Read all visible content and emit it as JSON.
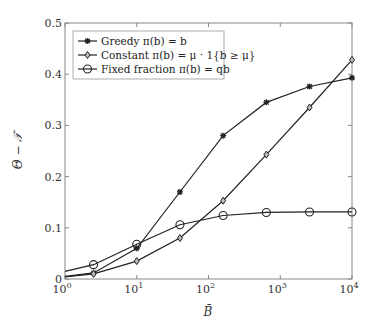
{
  "chart_data": {
    "type": "line",
    "title": "",
    "xlabel": "B̄",
    "ylabel": "Θ − 𝒯",
    "xscale": "log",
    "xlim": [
      1,
      10000
    ],
    "ylim": [
      0,
      0.5
    ],
    "grid": false,
    "legend_position": "upper left",
    "x_ticks": [
      {
        "v": 1,
        "base": "10",
        "exp": "0"
      },
      {
        "v": 10,
        "base": "10",
        "exp": "1"
      },
      {
        "v": 100,
        "base": "10",
        "exp": "2"
      },
      {
        "v": 1000,
        "base": "10",
        "exp": "3"
      },
      {
        "v": 10000,
        "base": "10",
        "exp": "4"
      }
    ],
    "y_ticks": [
      {
        "v": 0,
        "label": "0"
      },
      {
        "v": 0.1,
        "label": "0.1"
      },
      {
        "v": 0.2,
        "label": "0.2"
      },
      {
        "v": 0.3,
        "label": "0.3"
      },
      {
        "v": 0.4,
        "label": "0.4"
      },
      {
        "v": 0.5,
        "label": "0.5"
      }
    ],
    "x": [
      1,
      2.5,
      10,
      40,
      160,
      640,
      2560,
      10000
    ],
    "series": [
      {
        "name": "Greedy π(b) = b",
        "marker": "asterisk",
        "values": [
          0.005,
          0.012,
          0.06,
          0.17,
          0.28,
          0.345,
          0.376,
          0.393
        ]
      },
      {
        "name": "Constant π(b) = μ · 1{b ≥ μ}",
        "marker": "diamond",
        "values": [
          0.004,
          0.01,
          0.035,
          0.08,
          0.153,
          0.243,
          0.335,
          0.428
        ]
      },
      {
        "name": "Fixed fraction π(b) = qb",
        "marker": "circle",
        "values": [
          0.015,
          0.028,
          0.068,
          0.106,
          0.124,
          0.13,
          0.131,
          0.131
        ]
      }
    ]
  },
  "colors": {
    "line": "#222222",
    "axis": "#888888",
    "legend_border": "#999999"
  }
}
